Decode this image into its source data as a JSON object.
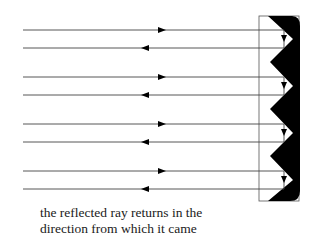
{
  "diagram": {
    "type": "retroreflector-corner-prism",
    "caption": {
      "line1": "the reflected ray returns in the",
      "line2": "direction from which it came"
    },
    "rays": [
      {
        "incoming_y": 30,
        "outgoing_y": 48
      },
      {
        "incoming_y": 77,
        "outgoing_y": 95
      },
      {
        "incoming_y": 124,
        "outgoing_y": 142
      },
      {
        "incoming_y": 171,
        "outgoing_y": 189
      }
    ],
    "colors": {
      "line": "#444444",
      "prism": "#000000",
      "outline": "#555555"
    }
  }
}
